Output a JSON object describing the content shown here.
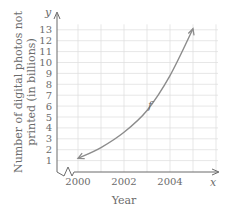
{
  "chart_data": {
    "type": "line",
    "title": "",
    "xlabel": "Year",
    "ylabel": "Number of digital photos not printed (in billions)",
    "ylabel_lines": [
      "Number of digital photos not",
      "printed (in billions)"
    ],
    "x_axis_symbol": "x",
    "y_axis_symbol": "y",
    "curve_label": "f",
    "x_ticks": [
      "2000",
      "2002",
      "2004"
    ],
    "y_ticks": [
      "1",
      "2",
      "3",
      "4",
      "5",
      "6",
      "7",
      "8",
      "9",
      "10",
      "11",
      "12",
      "13"
    ],
    "xlim": [
      1999,
      2005.5
    ],
    "ylim": [
      0,
      13.5
    ],
    "grid": true,
    "axis_break": true,
    "series": [
      {
        "name": "f",
        "x": [
          2000,
          2001,
          2002,
          2003,
          2004,
          2005
        ],
        "values": [
          1.2,
          2.2,
          3.6,
          5.6,
          8.8,
          13.1
        ]
      }
    ],
    "arrowheads": "both ends"
  }
}
